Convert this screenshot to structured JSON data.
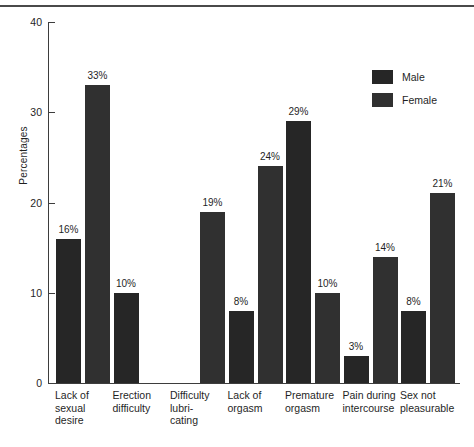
{
  "chart_data": {
    "type": "bar",
    "title": "",
    "xlabel": "",
    "ylabel": "Percentages",
    "ylim": [
      0,
      40
    ],
    "yticks": [
      0,
      10,
      20,
      30,
      40
    ],
    "ytick_labels": [
      "0",
      "10",
      "20",
      "30",
      "40"
    ],
    "grid": false,
    "legend_position": "top-right",
    "value_suffix": "%",
    "categories": [
      "Lack of sexual desire",
      "Erection difficulty",
      "Difficulty lubri-cating",
      "Lack of orgasm",
      "Premature orgasm",
      "Pain during intercourse",
      "Sex not pleasurable"
    ],
    "category_lines": [
      [
        "Lack of",
        "sexual",
        "desire"
      ],
      [
        "Erection",
        "difficulty"
      ],
      [
        "Difficulty",
        "lubri-",
        "cating"
      ],
      [
        "Lack of",
        "orgasm"
      ],
      [
        "Premature",
        "orgasm"
      ],
      [
        "Pain during",
        "intercourse"
      ],
      [
        "Sex not",
        "pleasurable"
      ]
    ],
    "series": [
      {
        "name": "Male",
        "color": "#262626",
        "values": [
          16,
          10,
          null,
          8,
          29,
          3,
          8
        ],
        "value_labels": [
          "16%",
          "10%",
          "",
          "8%",
          "29%",
          "3%",
          "8%"
        ]
      },
      {
        "name": "Female",
        "color": "#303030",
        "values": [
          33,
          null,
          19,
          24,
          10,
          14,
          21
        ],
        "value_labels": [
          "33%",
          "",
          "19%",
          "24%",
          "10%",
          "14%",
          "21%"
        ]
      }
    ]
  },
  "legend": {
    "items": [
      {
        "label": "Male",
        "color": "#262626"
      },
      {
        "label": "Female",
        "color": "#303030"
      }
    ]
  }
}
